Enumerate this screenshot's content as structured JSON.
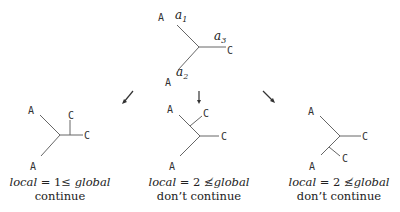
{
  "root_tree": {
    "leaf_top": "A",
    "leaf_bottom": "A",
    "leaf_right": "C",
    "edge_labels": {
      "a1": {
        "base": "a",
        "sub": "1"
      },
      "a2": {
        "base": "a",
        "sub": "2"
      },
      "a3": {
        "base": "a",
        "sub": "3"
      }
    }
  },
  "children": [
    {
      "leaf_top": "A",
      "leaf_bottom": "A",
      "leaf_c1": "C",
      "leaf_c2": "C",
      "caption_formula": {
        "lhs": "local",
        "eq": " = 1",
        "rel": "≤",
        "rhs": " global"
      },
      "caption_decision": "continue"
    },
    {
      "leaf_top": "A",
      "leaf_bottom": "A",
      "leaf_c1": "C",
      "leaf_c2": "C",
      "caption_formula": {
        "lhs": "local",
        "eq": " = 2",
        "rel": " ≰",
        "rhs": "global"
      },
      "caption_decision": "don’t continue"
    },
    {
      "leaf_top": "A",
      "leaf_bottom": "A",
      "leaf_c1": "C",
      "leaf_c2": "C",
      "caption_formula": {
        "lhs": "local",
        "eq": " = 2",
        "rel": " ≰",
        "rhs": "global"
      },
      "caption_decision": "don’t continue"
    }
  ]
}
